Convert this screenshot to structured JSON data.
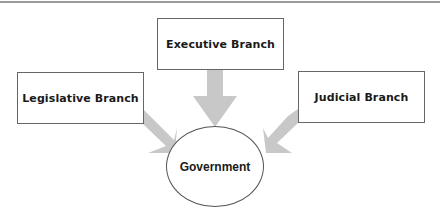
{
  "diagram": {
    "type": "flow",
    "center": {
      "label": "Government",
      "shape": "ellipse"
    },
    "nodes": [
      {
        "id": "legislative",
        "label": "Legislative Branch",
        "shape": "rectangle"
      },
      {
        "id": "executive",
        "label": "Executive Branch",
        "shape": "rectangle"
      },
      {
        "id": "judicial",
        "label": "Judicial Branch",
        "shape": "rectangle"
      }
    ],
    "edges": [
      {
        "from": "legislative",
        "to": "government"
      },
      {
        "from": "executive",
        "to": "government"
      },
      {
        "from": "judicial",
        "to": "government"
      }
    ],
    "colors": {
      "arrow": "#c8c8c8",
      "border": "#666666",
      "text": "#1a1a1a"
    }
  }
}
